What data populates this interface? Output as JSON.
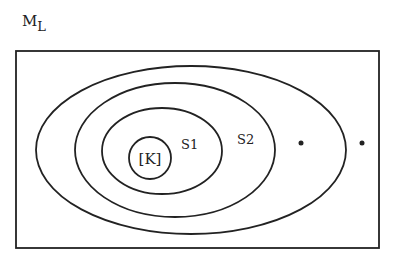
{
  "title": {
    "main": "M",
    "subscript": "L"
  },
  "frame": {
    "x": 16,
    "y": 51,
    "width": 363,
    "height": 197
  },
  "ellipses": [
    {
      "name": "outer",
      "cx": 191,
      "cy": 150,
      "rx": 155,
      "ry": 84
    },
    {
      "name": "s2",
      "cx": 175,
      "cy": 150,
      "rx": 100,
      "ry": 67
    },
    {
      "name": "s1",
      "cx": 162,
      "cy": 151,
      "rx": 60,
      "ry": 43
    }
  ],
  "core_circle": {
    "cx": 150,
    "cy": 158,
    "r": 21
  },
  "labels": {
    "core": "[K]",
    "s1": "S1",
    "s2": "S2"
  },
  "dots": [
    {
      "cx": 301,
      "cy": 143
    },
    {
      "cx": 362,
      "cy": 143
    }
  ],
  "colors": {
    "stroke": "#222222",
    "background": "#ffffff"
  }
}
